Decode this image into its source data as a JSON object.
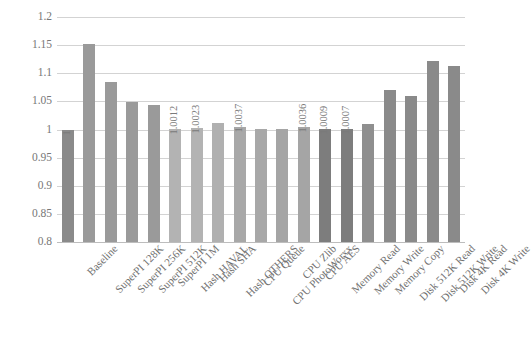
{
  "chart_data": {
    "type": "bar",
    "title": "",
    "xlabel": "",
    "ylabel": "",
    "ylim": [
      0.8,
      1.2
    ],
    "ytick_labels": [
      "1.2",
      "1.15",
      "1.1",
      "1.05",
      "1",
      "0.95",
      "0.9",
      "0.85",
      "0.8"
    ],
    "ytick_values": [
      1.2,
      1.15,
      1.1,
      1.05,
      1.0,
      0.95,
      0.9,
      0.85,
      0.8
    ],
    "grid": true,
    "legend": "none",
    "categories": [
      "Baseline",
      "SuperPI 128K",
      "SuperPI 256K",
      "SuperPI 512K",
      "SuperPI 1M",
      "Hash HAVAL",
      "Hash SHA",
      "Hash OTHERS",
      "CPU Queue",
      "CPU PhotoWorxx",
      "CPU Zlib",
      "CPU AES",
      "Memory Read",
      "Memory Write",
      "Memory Copy",
      "Disk 512K Read",
      "Disk 512K Write",
      "Disk 4K Read",
      "Disk 4K Write"
    ],
    "values": [
      1.0,
      1.1525,
      1.0845,
      1.0495,
      1.0435,
      1.0012,
      1.0023,
      1.0115,
      1.0037,
      1.0015,
      1.0015,
      1.0036,
      1.0009,
      1.0007,
      1.0105,
      1.0705,
      1.0595,
      1.1225,
      1.1125
    ],
    "bar_labels": [
      "1",
      "",
      "",
      "",
      "",
      "1.0012",
      "1.0023",
      "",
      "1.0037",
      "",
      "",
      "1.0036",
      "1.0009",
      "1.0007",
      "",
      "",
      "",
      "",
      ""
    ],
    "bar_colors": [
      "#8a8a8a",
      "#9a9a9a",
      "#9a9a9a",
      "#9a9a9a",
      "#9a9a9a",
      "#b3b3b3",
      "#b3b3b3",
      "#b0b0b0",
      "#a8a8a8",
      "#a8a8a8",
      "#a5a5a5",
      "#a5a5a5",
      "#7d7d7d",
      "#7d7d7d",
      "#8f8f8f",
      "#8a8a8a",
      "#8a8a8a",
      "#8a8a8a",
      "#8a8a8a"
    ]
  }
}
